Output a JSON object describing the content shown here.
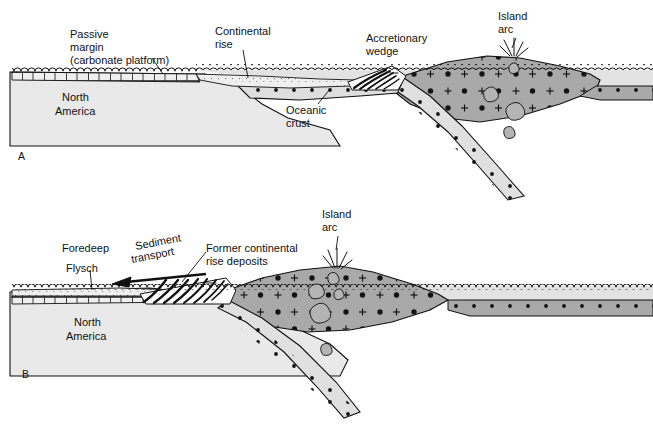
{
  "figure": {
    "title_alt": "Two-stage cross section of an island-arc collision with a passive continental margin",
    "background_color": "#ffffff",
    "line_color": "#111111"
  },
  "colors": {
    "continent": "#e9e9e9",
    "water": "#e3e3e3",
    "mantle_wedge": "#a9a9a9",
    "oceanic_crust": "#dedede",
    "slab": "#e0e0e0",
    "flysch": "#efefef",
    "wedge_white": "#ffffff",
    "outline": "#111111"
  },
  "panels": [
    {
      "id": "A",
      "panel_label": "A",
      "labels": [
        {
          "name": "passive-margin",
          "lines": [
            "Passive",
            "margin",
            "(carbonate platform)"
          ],
          "x": 70,
          "y": 30
        },
        {
          "name": "north-america",
          "lines": [
            "North",
            "America"
          ],
          "x": 60,
          "y": 95
        },
        {
          "name": "continental-rise",
          "lines": [
            "Continental",
            "rise"
          ],
          "x": 215,
          "y": 28
        },
        {
          "name": "oceanic-crust",
          "lines": [
            "Oceanic",
            "crust"
          ],
          "x": 288,
          "y": 110
        },
        {
          "name": "accretionary-wedge",
          "lines": [
            "Accretionary",
            "wedge"
          ],
          "x": 366,
          "y": 34
        },
        {
          "name": "island-arc",
          "lines": [
            "Island",
            "arc"
          ],
          "x": 498,
          "y": 12
        }
      ]
    },
    {
      "id": "B",
      "panel_label": "B",
      "labels": [
        {
          "name": "foredeep",
          "lines": [
            "Foredeep"
          ],
          "x": 62,
          "y": 245
        },
        {
          "name": "flysch",
          "lines": [
            "Flysch"
          ],
          "x": 66,
          "y": 265
        },
        {
          "name": "sediment-transport",
          "lines": [
            "Sediment",
            "transport"
          ],
          "x": 139,
          "y": 243
        },
        {
          "name": "former-continental-rise-deposits",
          "lines": [
            "Former continental",
            "rise deposits"
          ],
          "x": 208,
          "y": 245
        },
        {
          "name": "north-america",
          "lines": [
            "North",
            "America"
          ],
          "x": 72,
          "y": 320
        },
        {
          "name": "island-arc",
          "lines": [
            "Island",
            "arc"
          ],
          "x": 322,
          "y": 210
        }
      ]
    }
  ],
  "text": {
    "passive_margin_l1": "Passive",
    "passive_margin_l2": "margin",
    "passive_margin_l3": "(carbonate platform)",
    "continental_rise_l1": "Continental",
    "continental_rise_l2": "rise",
    "oceanic_crust_l1": "Oceanic",
    "oceanic_crust_l2": "crust",
    "accretionary_wedge_l1": "Accretionary",
    "accretionary_wedge_l2": "wedge",
    "island_arc_a_l1": "Island",
    "island_arc_a_l2": "arc",
    "north_america_a_l1": "North",
    "north_america_a_l2": "America",
    "panel_a": "A",
    "foredeep": "Foredeep",
    "flysch": "Flysch",
    "sediment_transport_l1": "Sediment",
    "sediment_transport_l2": "transport",
    "former_rise_l1": "Former continental",
    "former_rise_l2": "rise deposits",
    "island_arc_b_l1": "Island",
    "island_arc_b_l2": "arc",
    "north_america_b_l1": "North",
    "north_america_b_l2": "America",
    "panel_b": "B"
  }
}
